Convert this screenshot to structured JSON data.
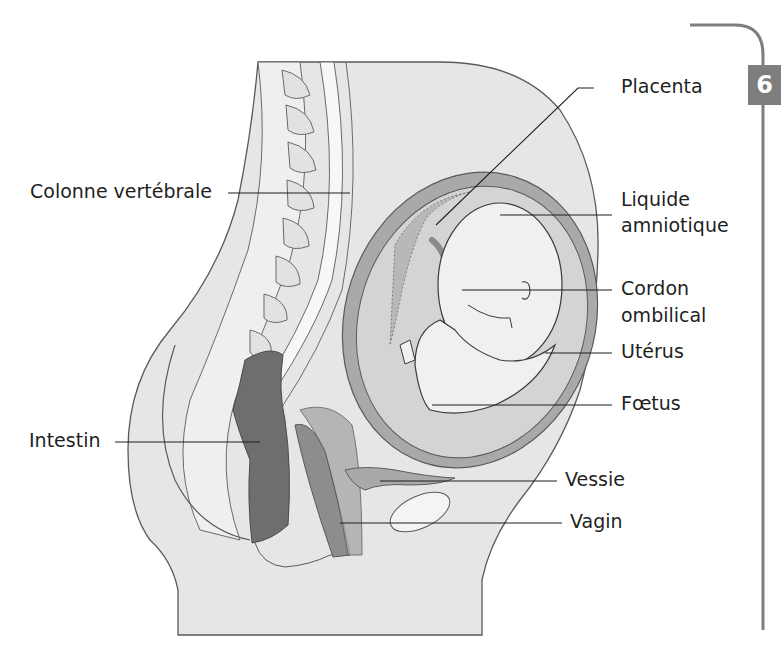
{
  "diagram": {
    "title": "",
    "chapter_number": "6",
    "labels": [
      {
        "id": "colonne",
        "text": "Colonne vertébrale",
        "side": "left"
      },
      {
        "id": "intestin",
        "text": "Intestin",
        "side": "left"
      },
      {
        "id": "placenta",
        "text": "Placenta",
        "side": "right"
      },
      {
        "id": "liquide",
        "text": "Liquide amniotique",
        "line1": "Liquide",
        "line2": "amniotique",
        "side": "right"
      },
      {
        "id": "cordon",
        "text": "Cordon ombilical",
        "line1": "Cordon",
        "line2": "ombilical",
        "side": "right"
      },
      {
        "id": "uterus",
        "text": "Utérus",
        "side": "right"
      },
      {
        "id": "foetus",
        "text": "Fœtus",
        "side": "right"
      },
      {
        "id": "vessie",
        "text": "Vessie",
        "side": "right"
      },
      {
        "id": "vagin",
        "text": "Vagin",
        "side": "right"
      }
    ],
    "colors": {
      "body_fill": "#e6e6e6",
      "outline": "#5a5a5a",
      "uterus_wall": "#a9a9a9",
      "amniotic": "#d4d4d4",
      "fetus": "#f0f0f0",
      "intestine": "#6e6e6e",
      "leader_line": "#1f1f1f",
      "chapter_tab": "#7e7e7e"
    }
  }
}
